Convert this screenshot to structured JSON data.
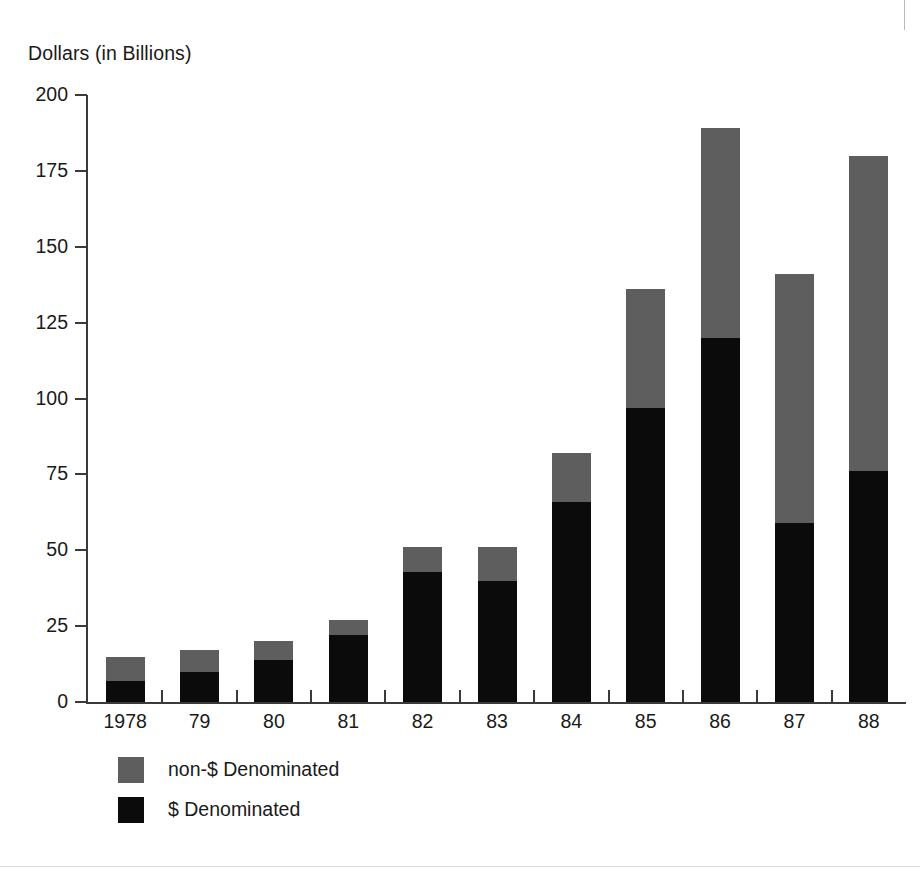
{
  "figure": {
    "y_axis_title": "Dollars (in Billions)",
    "axis_color": "#3a3a3a",
    "background": "#ffffff"
  },
  "legend": {
    "items": [
      {
        "label": "non-$ Denominated",
        "color": "#5e5e5e",
        "key": "non_dollar"
      },
      {
        "label": "$ Denominated",
        "color": "#0b0b0b",
        "key": "dollar"
      }
    ]
  },
  "chart_data": {
    "type": "bar",
    "stacked": true,
    "title": "",
    "subtitle": "",
    "xlabel": "",
    "ylabel": "Dollars (in Billions)",
    "ylim": [
      0,
      200
    ],
    "yticks": [
      0,
      25,
      50,
      75,
      100,
      125,
      150,
      175,
      200
    ],
    "ytick_labels": [
      "0",
      "25",
      "50",
      "75",
      "100",
      "125",
      "150",
      "175",
      "200"
    ],
    "grid": false,
    "legend_position": "bottom-left",
    "categories": [
      "1978",
      "79",
      "80",
      "81",
      "82",
      "83",
      "84",
      "85",
      "86",
      "87",
      "88"
    ],
    "series": [
      {
        "name": "$ Denominated",
        "color": "#0b0b0b",
        "values": [
          7,
          10,
          14,
          22,
          43,
          40,
          66,
          97,
          120,
          59,
          76
        ]
      },
      {
        "name": "non-$ Denominated",
        "color": "#5e5e5e",
        "values": [
          8,
          7,
          6,
          5,
          8,
          11,
          16,
          39,
          69,
          82,
          104
        ]
      }
    ],
    "totals": [
      15,
      17,
      20,
      27,
      51,
      51,
      82,
      136,
      189,
      141,
      180
    ]
  }
}
